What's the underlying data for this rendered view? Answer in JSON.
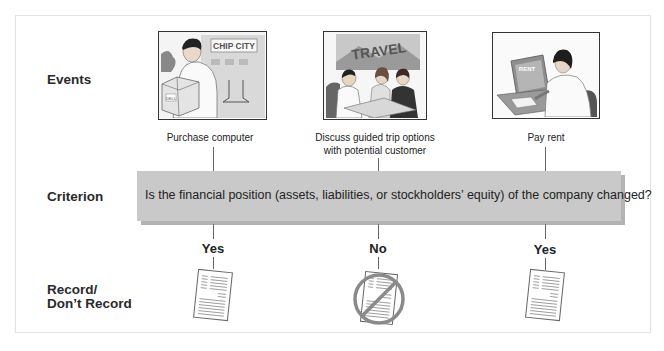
{
  "rows": {
    "events": "Events",
    "criterion": "Criterion",
    "record_line1": "Record/",
    "record_line2": "Don’t Record"
  },
  "events": [
    {
      "caption_line1": "Purchase computer",
      "caption_line2": "",
      "sign_text": "CHIP CITY",
      "box_text": "DELL",
      "answer": "Yes",
      "record": true
    },
    {
      "caption_line1": "Discuss guided trip options",
      "caption_line2": "with potential customer",
      "sign_text": "TRAVEL",
      "answer": "No",
      "record": false
    },
    {
      "caption_line1": "Pay rent",
      "caption_line2": "",
      "sign_text": "RENT",
      "answer": "Yes",
      "record": true
    }
  ],
  "criterion": {
    "question": "Is the financial position (assets, liabilities, or stockholders’ equity) of the company changed?"
  },
  "colors": {
    "criterion_box": "#c9c9c9",
    "criterion_shadow": "#b3b3b3",
    "frame_border": "#e2e2e2"
  }
}
